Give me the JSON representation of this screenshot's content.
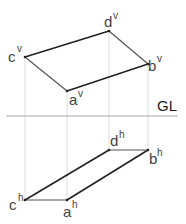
{
  "diagram": {
    "reference_line": {
      "label": "GL",
      "y": 116,
      "x1": 6,
      "x2": 178,
      "color": "#aaaaaa"
    },
    "colors": {
      "edge": "#222222",
      "projector": "#dddddd",
      "label": "#444444"
    },
    "front_view": {
      "points": [
        {
          "id": "c",
          "sup": "v",
          "x": 25,
          "y": 57
        },
        {
          "id": "d",
          "sup": "v",
          "x": 109,
          "y": 31
        },
        {
          "id": "b",
          "sup": "v",
          "x": 148,
          "y": 64
        },
        {
          "id": "a",
          "sup": "v",
          "x": 67,
          "y": 91
        }
      ],
      "labels": {
        "c": "c",
        "c_sup": "v",
        "d": "d",
        "d_sup": "v",
        "b": "b",
        "b_sup": "v",
        "a": "a",
        "a_sup": "v"
      }
    },
    "top_view": {
      "points": [
        {
          "id": "c",
          "sup": "h",
          "x": 25,
          "y": 200
        },
        {
          "id": "a",
          "sup": "h",
          "x": 67,
          "y": 200
        },
        {
          "id": "b",
          "sup": "h",
          "x": 148,
          "y": 150
        },
        {
          "id": "d",
          "sup": "h",
          "x": 109,
          "y": 150
        }
      ],
      "labels": {
        "c": "c",
        "c_sup": "h",
        "d": "d",
        "d_sup": "h",
        "b": "b",
        "b_sup": "h",
        "a": "a",
        "a_sup": "h"
      }
    },
    "gl_label": "GL"
  }
}
